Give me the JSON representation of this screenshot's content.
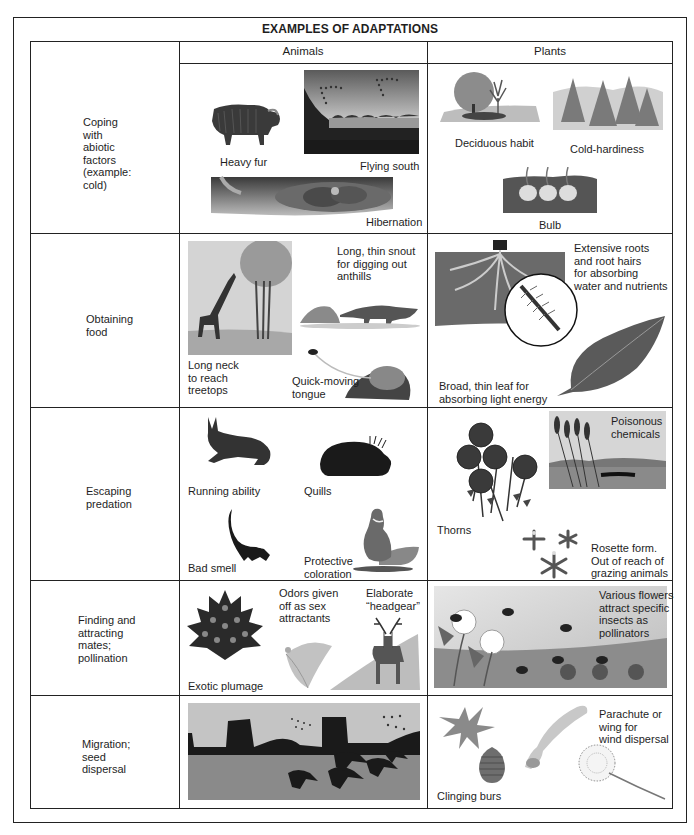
{
  "title": "EXAMPLES OF ADAPTATIONS",
  "columns": {
    "animals": "Animals",
    "plants": "Plants"
  },
  "rows": [
    {
      "label": "Coping\nwith\nabiotic\nfactors\n(example:\ncold)",
      "animals": [
        {
          "caption": "Heavy fur",
          "image": "musk-ox"
        },
        {
          "caption": "Flying south",
          "image": "geese-migrating-over-lake"
        },
        {
          "caption": "Hibernation",
          "image": "bears-in-den"
        }
      ],
      "plants": [
        {
          "caption": "Deciduous habit",
          "image": "deciduous-trees"
        },
        {
          "caption": "Cold-hardiness",
          "image": "conifer-forest"
        },
        {
          "caption": "Bulb",
          "image": "bulbs-in-soil"
        }
      ]
    },
    {
      "label": "Obtaining\nfood",
      "animals": [
        {
          "caption": "Long neck\nto reach\ntreetops",
          "image": "giraffe-and-tree"
        },
        {
          "caption": "Long, thin snout\nfor digging out\nanthills",
          "image": "anteater-and-anthill"
        },
        {
          "caption": "Quick-moving\ntongue",
          "image": "frog-catching-fly"
        }
      ],
      "plants": [
        {
          "caption": "Extensive roots\nand root hairs\nfor absorbing\nwater and nutrients",
          "image": "root-system-with-magnified-root-hairs"
        },
        {
          "caption": "Broad, thin leaf for\nabsorbing light energy",
          "image": "leaf"
        }
      ]
    },
    {
      "label": "Escaping\npredation",
      "animals": [
        {
          "caption": "Running ability",
          "image": "hare"
        },
        {
          "caption": "Quills",
          "image": "porcupine"
        },
        {
          "caption": "Bad smell",
          "image": "skunk"
        },
        {
          "caption": "Protective\ncoloration",
          "image": "grouse"
        }
      ],
      "plants": [
        {
          "caption": "Thorns",
          "image": "roses"
        },
        {
          "caption": "Poisonous\nchemicals",
          "image": "cattails-marsh"
        },
        {
          "caption": "Rosette form.\nOut of reach of\ngrazing animals",
          "image": "rosette-plants"
        }
      ]
    },
    {
      "label": "Finding and\nattracting\nmates;\npollination",
      "animals": [
        {
          "caption": "Exotic plumage",
          "image": "peacock-tail"
        },
        {
          "caption": "Odors given\noff as sex\nattractants",
          "image": "moth"
        },
        {
          "caption": "Elaborate\n“headgear”",
          "image": "deer-with-antlers"
        }
      ],
      "plants": [
        {
          "caption": "Various flowers\nattract specific\ninsects as\npollinators",
          "image": "flowers-and-bees"
        }
      ]
    },
    {
      "label": "Migration;\nseed\ndispersal",
      "animals": [
        {
          "caption": "",
          "image": "horses-and-birds-migrating"
        }
      ],
      "plants": [
        {
          "caption": "Clinging burs",
          "image": "burs"
        },
        {
          "caption": "Parachute or\nwing for\nwind dispersal",
          "image": "winged-seed-and-dandelion"
        }
      ]
    }
  ],
  "colors": {
    "border": "#222222",
    "text": "#1e1e1e",
    "illustration_dark": "#2a2a2a",
    "illustration_mid": "#8a8a8a",
    "illustration_light": "#d4d4d4"
  }
}
